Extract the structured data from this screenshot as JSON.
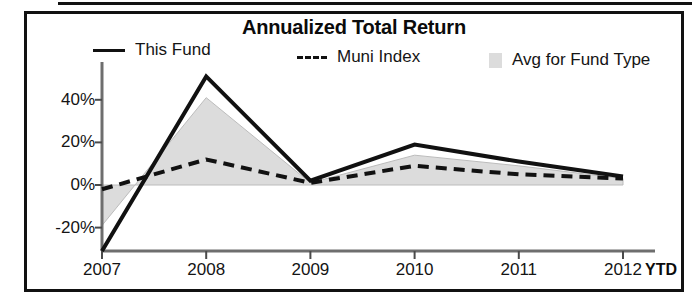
{
  "chart_data": {
    "type": "line",
    "title": "Annualized Total Return",
    "xlabel": "",
    "ylabel": "",
    "x": [
      "2007",
      "2008",
      "2009",
      "2010",
      "2011",
      "2012"
    ],
    "x_suffix_label": "YTD",
    "ytick_labels": [
      "40%",
      "20%",
      "0%",
      "-20%"
    ],
    "ytick_values": [
      40,
      20,
      0,
      -20
    ],
    "ylim": [
      -32,
      55
    ],
    "grid": false,
    "legend_position": "top",
    "series": [
      {
        "name": "This Fund",
        "style": "solid-line",
        "color": "#111111",
        "values": [
          -31,
          51,
          2,
          19,
          11,
          4
        ]
      },
      {
        "name": "Muni Index",
        "style": "dashed-line",
        "color": "#111111",
        "values": [
          -2,
          12,
          1,
          9,
          5,
          3
        ]
      },
      {
        "name": "Avg for Fund Type",
        "style": "filled-area",
        "color": "#dcdcdc",
        "values": [
          -19,
          41,
          1,
          14,
          9,
          3
        ]
      }
    ]
  },
  "chart": {
    "title": "Annualized Total Return",
    "legend": [
      {
        "label": "This Fund",
        "marker": "solid-line-swatch"
      },
      {
        "label": "Muni Index",
        "marker": "dashed-line-swatch"
      },
      {
        "label": "Avg for Fund Type",
        "marker": "area-swatch"
      }
    ],
    "y_axis": {
      "ticks": [
        "40%",
        "20%",
        "0%",
        "-20%"
      ]
    },
    "x_axis": {
      "ticks": [
        "2007",
        "2008",
        "2009",
        "2010",
        "2011",
        "2012"
      ],
      "suffix": "YTD"
    }
  }
}
